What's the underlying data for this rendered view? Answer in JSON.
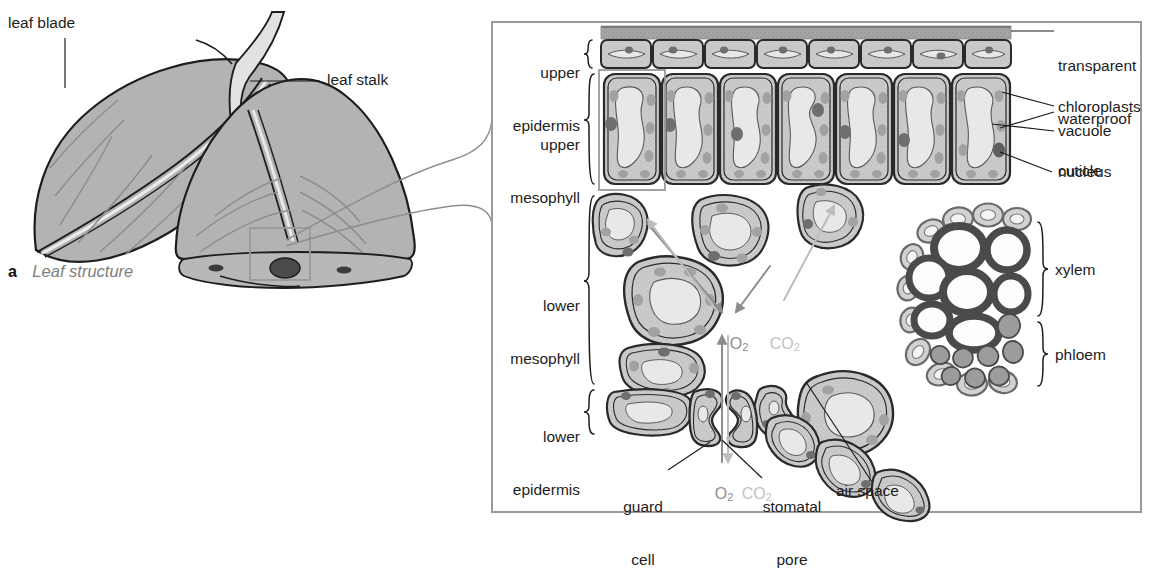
{
  "figure": {
    "caption_marker": "a",
    "caption_text": "Leaf structure"
  },
  "left_diagram": {
    "name": "whole-leaf-sketch",
    "labels": [
      {
        "id": "leaf-blade",
        "text": "leaf blade"
      },
      {
        "id": "leaf-stalk",
        "text": "leaf stalk"
      }
    ]
  },
  "right_panel": {
    "name": "leaf-cross-section",
    "left_labels": [
      {
        "id": "upper-epidermis",
        "line1": "upper",
        "line2": "epidermis"
      },
      {
        "id": "upper-mesophyll",
        "line1": "upper",
        "line2": "mesophyll"
      },
      {
        "id": "lower-mesophyll",
        "line1": "lower",
        "line2": "mesophyll"
      },
      {
        "id": "lower-epidermis",
        "line1": "lower",
        "line2": "epidermis"
      }
    ],
    "right_labels": [
      {
        "id": "cuticle",
        "line1": "transparent",
        "line2": "waterproof",
        "line3": "cuticle"
      },
      {
        "id": "chloroplasts",
        "line1": "chloroplasts"
      },
      {
        "id": "vacuole",
        "line1": "vacuole"
      },
      {
        "id": "nucleus",
        "line1": "nucleus"
      },
      {
        "id": "xylem",
        "line1": "xylem"
      },
      {
        "id": "phloem",
        "line1": "phloem"
      }
    ],
    "bottom_labels": [
      {
        "id": "guard-cell",
        "line1": "guard",
        "line2": "cell"
      },
      {
        "id": "stomatal-pore",
        "line1": "stomatal",
        "line2": "pore"
      },
      {
        "id": "air-space",
        "line1": "air space"
      }
    ],
    "gas_labels": [
      {
        "id": "oxygen-out-mesophyll",
        "formula": "O",
        "sub": "2",
        "tone": "o2"
      },
      {
        "id": "carbon-dioxide-in-mesophyll",
        "formula": "CO",
        "sub": "2",
        "tone": "co2"
      },
      {
        "id": "oxygen-through-pore",
        "formula": "O",
        "sub": "2",
        "tone": "o2"
      },
      {
        "id": "carbon-dioxide-through-pore",
        "formula": "CO",
        "sub": "2",
        "tone": "co2"
      }
    ]
  },
  "colors": {
    "ink": "#1d1d1d",
    "leaf_fill": "#b3b3b3",
    "vein_fill": "#e2e2e2",
    "cell_wall": "#2a2a2a",
    "cytoplasm": "#c9c9c9",
    "vacuole": "#e8e8e8",
    "chloroplast": "#a2a2a2",
    "nucleus": "#6e6e6e",
    "cuticle": "#9a9a9a",
    "xylem_wall": "#4a4a4a",
    "xylem_lumen": "#fdfdfd",
    "phloem_fill": "#9c9c9c",
    "sheath_fill": "#d2d2d2",
    "panel_border": "#8a8a8a",
    "caption_italic": "#7d7d7d",
    "gas_o2": "#8d8d8d",
    "gas_co2": "#c2c2c2"
  }
}
